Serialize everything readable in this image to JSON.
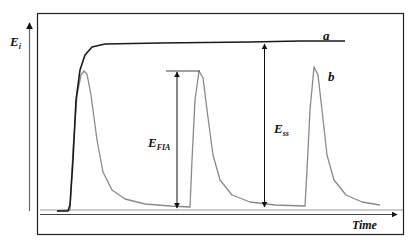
{
  "chart_data": {
    "type": "line",
    "title": "",
    "xlabel": "Time",
    "ylabel": "E_i",
    "grid": false,
    "legend": "inline labels next to curves",
    "series": [
      {
        "name": "a",
        "description": "Steady-state response: sharp rise to plateau",
        "color": "#1a1a1a",
        "points": [
          [
            57,
            211
          ],
          [
            68,
            211
          ],
          [
            70,
            205
          ],
          [
            73,
            160
          ],
          [
            76,
            100
          ],
          [
            80,
            70
          ],
          [
            85,
            55
          ],
          [
            92,
            47
          ],
          [
            105,
            44
          ],
          [
            160,
            43
          ],
          [
            250,
            42
          ],
          [
            300,
            41
          ],
          [
            345,
            41
          ]
        ]
      },
      {
        "name": "b",
        "description": "Flow-injection peaks (three repeated injections)",
        "color": "#8a8a8a",
        "points": [
          [
            57,
            211
          ],
          [
            70,
            210
          ],
          [
            73,
            150
          ],
          [
            77,
            95
          ],
          [
            81,
            75
          ],
          [
            84,
            71
          ],
          [
            87,
            74
          ],
          [
            91,
            95
          ],
          [
            97,
            140
          ],
          [
            103,
            172
          ],
          [
            112,
            190
          ],
          [
            125,
            199
          ],
          [
            145,
            204
          ],
          [
            170,
            206
          ],
          [
            190,
            207
          ],
          [
            192,
            160
          ],
          [
            195,
            100
          ],
          [
            199,
            71
          ],
          [
            203,
            78
          ],
          [
            207,
            110
          ],
          [
            213,
            155
          ],
          [
            220,
            180
          ],
          [
            232,
            195
          ],
          [
            250,
            202
          ],
          [
            275,
            205
          ],
          [
            305,
            206
          ],
          [
            307,
            170
          ],
          [
            310,
            110
          ],
          [
            314,
            67
          ],
          [
            318,
            75
          ],
          [
            322,
            110
          ],
          [
            327,
            155
          ],
          [
            334,
            180
          ],
          [
            346,
            195
          ],
          [
            362,
            202
          ],
          [
            380,
            205
          ]
        ]
      }
    ],
    "annotations": [
      {
        "label": "E_FIA",
        "meaning": "flow-injection peak height",
        "x": 177,
        "from_y": 71,
        "to_y": 209
      },
      {
        "label": "E_ss",
        "meaning": "steady-state signal height",
        "x": 264,
        "from_y": 43,
        "to_y": 208
      }
    ],
    "labels": {
      "curve_a": "a",
      "curve_b": "b",
      "y_axis_main": "E",
      "y_axis_sub": "i",
      "x_axis": "Time",
      "efia_main": "E",
      "efia_sub": "FIA",
      "ess_main": "E",
      "ess_sub": "ss"
    }
  }
}
